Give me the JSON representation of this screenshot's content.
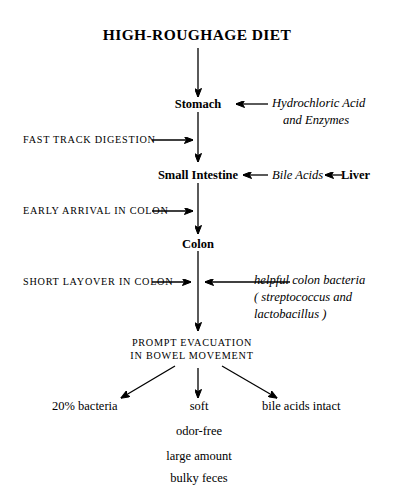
{
  "diagram": {
    "title": "HIGH-ROUGHAGE DIET",
    "background_color": "#ffffff",
    "ink_color": "#000000",
    "nodes": {
      "stomach": "Stomach",
      "small_intestine": "Small Intestine",
      "colon": "Colon",
      "liver": "Liver",
      "evacuation_line1": "PROMPT EVACUATION",
      "evacuation_line2": "IN BOWEL MOVEMENT"
    },
    "left_annotations": [
      {
        "label": "FAST TRACK DIGESTION"
      },
      {
        "label": "EARLY ARRIVAL IN COLON"
      },
      {
        "label": "SHORT LAYOVER IN COLON"
      }
    ],
    "right_annotations": [
      {
        "line1": "Hydrochloric Acid",
        "line2": "and Enzymes"
      },
      {
        "label": "Bile Acids"
      },
      {
        "line1": "helpful colon bacteria",
        "line2": "( streptococcus and",
        "line3": "lactobacillus )"
      }
    ],
    "outcomes": {
      "left": "20% bacteria",
      "right": "bile acids intact",
      "center": [
        "soft",
        "odor-free",
        "large amount",
        "bulky feces"
      ]
    }
  }
}
